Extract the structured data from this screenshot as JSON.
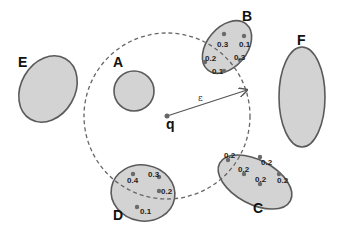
{
  "query": {
    "label": "q",
    "x": 167,
    "y": 116
  },
  "epsilon": {
    "label": "ε",
    "radius": 83,
    "arrow_to": [
      247,
      90
    ]
  },
  "regions": [
    {
      "id": "A",
      "label": "A",
      "shape": "circle",
      "cx": 134,
      "cy": 91,
      "rx": 20,
      "ry": 20,
      "rot": 0,
      "label_pos": [
        113,
        67
      ],
      "points": []
    },
    {
      "id": "B",
      "label": "B",
      "shape": "ellipse",
      "cx": 227,
      "cy": 47,
      "rx": 20,
      "ry": 30,
      "rot": 40,
      "label_pos": [
        242,
        21
      ],
      "points": [
        {
          "x": 224,
          "y": 34,
          "v": "0.3",
          "tx": 217,
          "ty": 47
        },
        {
          "x": 244,
          "y": 36,
          "v": "0.1",
          "tx": 239,
          "ty": 47
        },
        {
          "x": 240,
          "y": 60,
          "v": "0.3",
          "tx": 234,
          "ty": 60
        },
        {
          "x": 205,
          "y": 62,
          "v": "0.2",
          "tx": 205,
          "ty": 61
        },
        {
          "x": 224,
          "y": 71,
          "v": "0.1",
          "tx": 212,
          "ty": 74
        }
      ]
    },
    {
      "id": "C",
      "label": "C",
      "shape": "ellipse",
      "cx": 255,
      "cy": 182,
      "rx": 40,
      "ry": 22,
      "rot": 28,
      "label_pos": [
        253,
        213
      ],
      "points": [
        {
          "x": 228,
          "y": 160,
          "v": "0.2",
          "tx": 224,
          "ty": 158
        },
        {
          "x": 260,
          "y": 157,
          "v": "0.2",
          "tx": 261,
          "ty": 165
        },
        {
          "x": 244,
          "y": 174,
          "v": "0.2",
          "tx": 238,
          "ty": 172
        },
        {
          "x": 279,
          "y": 174,
          "v": "0.2",
          "tx": 277,
          "ty": 183
        },
        {
          "x": 260,
          "y": 184,
          "v": "0.2",
          "tx": 255,
          "ty": 182
        }
      ]
    },
    {
      "id": "D",
      "label": "D",
      "shape": "ellipse",
      "cx": 143,
      "cy": 193,
      "rx": 32,
      "ry": 28,
      "rot": 10,
      "label_pos": [
        113,
        220
      ],
      "points": [
        {
          "x": 133,
          "y": 174,
          "v": "0.4",
          "tx": 127,
          "ty": 183
        },
        {
          "x": 159,
          "y": 177,
          "v": "0.3",
          "tx": 148,
          "ty": 177
        },
        {
          "x": 159,
          "y": 191,
          "v": "0.2",
          "tx": 161,
          "ty": 194
        },
        {
          "x": 137,
          "y": 207,
          "v": "0.1",
          "tx": 140,
          "ty": 214
        }
      ]
    },
    {
      "id": "E",
      "label": "E",
      "shape": "ellipse",
      "cx": 48,
      "cy": 89,
      "rx": 27,
      "ry": 35,
      "rot": 30,
      "label_pos": [
        18,
        67
      ],
      "points": []
    },
    {
      "id": "F",
      "label": "F",
      "shape": "ellipse",
      "cx": 302,
      "cy": 97,
      "rx": 23,
      "ry": 50,
      "rot": 0,
      "label_pos": [
        297,
        45
      ],
      "points": []
    }
  ]
}
